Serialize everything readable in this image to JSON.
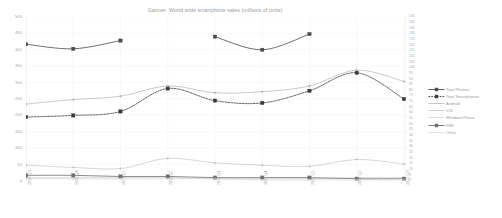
{
  "chart_data": {
    "type": "line",
    "title": "Gartner: World-wide smartphone sales (millions of units)",
    "xlabel": "",
    "ylabel": "",
    "grid": true,
    "legend_position": "right",
    "categories": [
      "2010 Q3",
      "2010 Q4",
      "2011 Q1",
      "2011 Q2",
      "2011 Q3",
      "2011 Q4",
      "2012 Q1",
      "2012 Q2",
      "2012 Q3"
    ],
    "ylim": [
      0,
      500
    ],
    "yticks": [
      0,
      50,
      100,
      150,
      200,
      250,
      300,
      350,
      400,
      450,
      500
    ],
    "ylim_right": [
      0,
      145
    ],
    "yticks_right": [
      0,
      5,
      10,
      15,
      20,
      25,
      30,
      35,
      40,
      45,
      50,
      55,
      60,
      65,
      70,
      75,
      80,
      85,
      90,
      95,
      100,
      105,
      110,
      115,
      120,
      125,
      130,
      135,
      140,
      145
    ],
    "series": [
      {
        "name": "Total Phones",
        "axis": "left",
        "style": "solid",
        "marker": "square",
        "color": "#4a4a4a",
        "values": [
          417,
          403,
          428,
          null,
          440,
          400,
          448,
          null,
          null
        ]
      },
      {
        "name": "Total Smartphones",
        "axis": "left",
        "style": "dotted",
        "marker": "square",
        "color": "#3a3a3a",
        "values": [
          195,
          200,
          212,
          282,
          245,
          238,
          275,
          330,
          250
        ]
      },
      {
        "name": "Android",
        "axis": "right",
        "style": "solid",
        "marker": "plus",
        "color": "#9e9e9e",
        "values": [
          68,
          72,
          75,
          84,
          78,
          79,
          84,
          98,
          88
        ]
      },
      {
        "name": "iOS",
        "axis": "right",
        "style": "solid",
        "marker": "plus",
        "color": "#b5b5b5",
        "values": [
          14,
          12,
          11,
          20,
          16,
          14,
          13,
          19,
          15
        ]
      },
      {
        "name": "Windows Phone",
        "axis": "right",
        "style": "solid",
        "marker": "plus",
        "color": "#c2c2c2",
        "values": [
          3,
          3,
          3,
          3,
          2,
          2,
          2,
          3,
          3
        ]
      },
      {
        "name": "RIM",
        "axis": "right",
        "style": "solid",
        "marker": "square",
        "color": "#6e6e6e",
        "values": [
          5,
          5,
          4,
          4,
          3,
          3,
          3,
          2,
          2
        ]
      },
      {
        "name": "Other",
        "axis": "right",
        "style": "solid",
        "marker": "plus",
        "color": "#cfcfcf",
        "values": [
          2,
          2,
          2,
          2,
          2,
          1,
          1,
          1,
          1
        ]
      }
    ]
  }
}
